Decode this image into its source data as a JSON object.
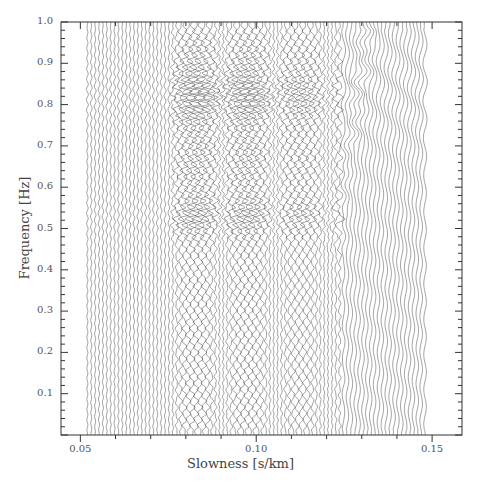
{
  "chart_data": {
    "type": "wiggle-trace",
    "title": "",
    "xlabel": "Slowness [s/km]",
    "ylabel": "Frequency [Hz]",
    "xlim": [
      0.0445,
      0.1585
    ],
    "ylim": [
      0.0,
      1.0
    ],
    "xticks_major": [
      0.05,
      0.1,
      0.15
    ],
    "xtick_labels": [
      "0.05",
      "0.10",
      "0.15"
    ],
    "xticks_minor_step": 0.01,
    "yticks_major": [
      0.1,
      0.2,
      0.3,
      0.4,
      0.5,
      0.6,
      0.7,
      0.8,
      0.9,
      1.0
    ],
    "ytick_labels": [
      "0.1",
      "0.2",
      "0.3",
      "0.4",
      "0.5",
      "0.6",
      "0.7",
      "0.8",
      "0.9",
      "1.0"
    ],
    "yticks_minor_step": 0.02,
    "grid": false,
    "legend": null,
    "traces": {
      "count": 88,
      "slowness_start": 0.052,
      "slowness_end": 0.148,
      "orientation": "vertical (one trace per slowness value, amplitude plotted horizontally vs frequency)"
    },
    "energy_regions": [
      {
        "description": "quiet/low amplitude",
        "slowness": [
          0.052,
          0.075
        ],
        "frequency": [
          0.0,
          1.0
        ]
      },
      {
        "description": "strong incoherent energy",
        "slowness": [
          0.076,
          0.122
        ],
        "frequency": [
          0.76,
          0.88
        ]
      },
      {
        "description": "strong energy",
        "slowness": [
          0.076,
          0.112
        ],
        "frequency": [
          0.49,
          0.57
        ]
      },
      {
        "description": "moderate interference pattern",
        "slowness": [
          0.076,
          0.122
        ],
        "frequency": [
          0.15,
          0.45
        ]
      },
      {
        "description": "coherent curved arrival",
        "slowness": [
          0.118,
          0.132
        ],
        "frequency": [
          0.45,
          1.0
        ]
      },
      {
        "description": "smooth low-amplitude wiggles",
        "slowness": [
          0.125,
          0.148
        ],
        "frequency": [
          0.0,
          1.0
        ]
      }
    ]
  },
  "plot": {
    "frame_left_px": 61,
    "frame_right_px": 462,
    "frame_top_px": 22,
    "frame_bottom_px": 435,
    "trace_color": "#3a3a3a",
    "axis_color": "#333333"
  }
}
